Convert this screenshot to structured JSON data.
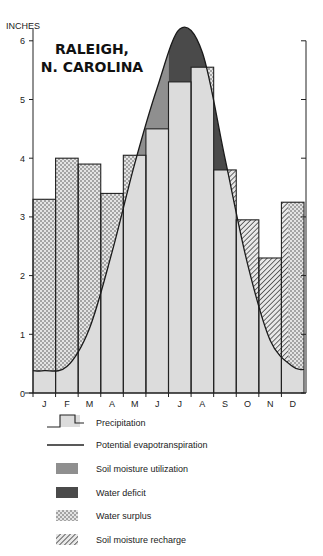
{
  "chart_data": {
    "type": "bar",
    "title": "RALEIGH, N. CAROLINA",
    "ylabel": "INCHES",
    "xlabel": "",
    "ylim": [
      0,
      6.3
    ],
    "yticks": [
      0,
      1,
      2,
      3,
      4,
      5,
      6
    ],
    "categories": [
      "J",
      "F",
      "M",
      "A",
      "M",
      "J",
      "J",
      "A",
      "S",
      "O",
      "N",
      "D"
    ],
    "series": [
      {
        "name": "Precipitation",
        "type": "bar",
        "values": [
          3.3,
          4.0,
          3.9,
          3.4,
          4.05,
          4.5,
          5.3,
          5.55,
          3.8,
          2.95,
          2.3,
          3.25
        ]
      },
      {
        "name": "Potential evapotranspiration",
        "type": "line",
        "values": [
          0.38,
          0.45,
          1.1,
          2.4,
          3.9,
          5.2,
          6.2,
          5.8,
          4.0,
          2.2,
          0.9,
          0.45
        ]
      }
    ],
    "legend_position": "bottom",
    "grid": false
  },
  "legend": [
    {
      "key": "precipitation",
      "label": "Precipitation"
    },
    {
      "key": "pe",
      "label": "Potential evapotranspiration"
    },
    {
      "key": "utilization",
      "label": "Soil moisture utilization"
    },
    {
      "key": "deficit",
      "label": "Water deficit"
    },
    {
      "key": "surplus",
      "label": "Water surplus"
    },
    {
      "key": "recharge",
      "label": "Soil moisture recharge"
    }
  ],
  "colors": {
    "precipitation": "#dcdcdc",
    "utilization": "#8f8f8f",
    "deficit": "#4a4a4a",
    "line": "#1a1a1a"
  }
}
